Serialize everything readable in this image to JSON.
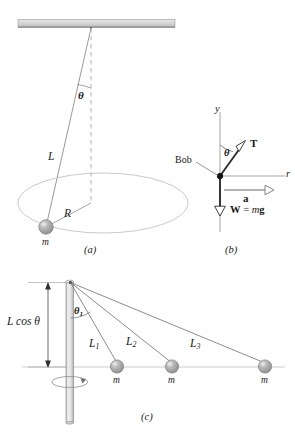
{
  "figure": {
    "colors": {
      "stroke": "#8a8a8a",
      "dark_stroke": "#3a3a3a",
      "ceiling_fill": "#cfcfcf",
      "ball_fill": "#a8a8a8",
      "ball_highlight": "#d8d8d8",
      "rod_fill": "#e2e2e2",
      "text": "#1a1a1a"
    }
  },
  "panel_a": {
    "caption": "(a)",
    "labels": {
      "angle": "θ",
      "string_length": "L",
      "radius": "R",
      "mass": "m"
    }
  },
  "panel_b": {
    "caption": "(b)",
    "labels": {
      "y_axis": "y",
      "r_axis": "r",
      "angle": "θ",
      "tension": "T",
      "bob": "Bob",
      "acceleration": "a",
      "weight": "W = mg",
      "weight_symbol": "W",
      "weight_equals": " = ",
      "weight_value": "mg"
    }
  },
  "panel_c": {
    "caption": "(c)",
    "labels": {
      "height": "L cos θ",
      "angle": "θ",
      "angle_sub": "1",
      "string_1": "L",
      "string_1_sub": "1",
      "string_2": "L",
      "string_2_sub": "2",
      "string_3": "L",
      "string_3_sub": "3",
      "mass_1": "m",
      "mass_2": "m",
      "mass_3": "m"
    }
  }
}
